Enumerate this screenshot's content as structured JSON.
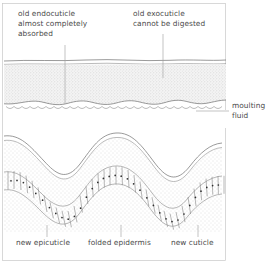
{
  "figure": {
    "frame": {
      "x": 2,
      "y": 3,
      "width": 224,
      "height": 258,
      "color": "#c8c8c8"
    }
  },
  "labels": {
    "top_left": {
      "name": "old-endocuticle-label",
      "lines": [
        "old endocuticle",
        "almost completely",
        "absorbed"
      ],
      "x": 18,
      "y": 16,
      "leader": {
        "x": 65,
        "y1": 45,
        "y2": 104
      }
    },
    "top_right": {
      "name": "old-exocuticle-label",
      "lines": [
        "old exocuticle",
        "cannot be digested"
      ],
      "x": 133,
      "y": 16,
      "leader": {
        "x": 163,
        "y1": 34,
        "y2": 78
      }
    },
    "right": {
      "name": "moulting-fluid-label",
      "lines": [
        "moulting",
        "fluid"
      ],
      "x": 232,
      "y": 104,
      "leader": {
        "x1": 196,
        "x2": 229,
        "y": 111
      }
    },
    "bottom": [
      {
        "name": "new-epicuticle-label",
        "text": "new epicuticle",
        "x": 16,
        "y": 245,
        "leader": {
          "x": 47,
          "y1": 225,
          "y2": 237
        }
      },
      {
        "name": "folded-epidermis-label",
        "text": "folded epidermis",
        "x": 88,
        "y": 245,
        "leader": {
          "x": 121,
          "y1": 225,
          "y2": 237
        }
      },
      {
        "name": "new-cuticle-label",
        "text": "new cuticle",
        "x": 171,
        "y": 245,
        "leader": {
          "x": 198,
          "y1": 225,
          "y2": 237
        }
      }
    ]
  },
  "layers": {
    "old_epicuticle": {
      "name": "old-epicuticle-band",
      "y": 60,
      "color": "#6e6e6e"
    },
    "old_exocuticle": {
      "name": "old-exocuticle-band",
      "y_top": 64,
      "y_bottom": 99,
      "fill": "#f2f2f2",
      "stipple": "fine"
    },
    "moulting_fluid_gap": {
      "name": "moulting-fluid-zone",
      "y_top": 99,
      "y_bottom": 128,
      "fill": "#ffffff"
    },
    "new_epicuticle": {
      "name": "new-epicuticle-wavy-line",
      "color": "#5a5a5a",
      "wave_amplitude": 17
    },
    "new_cuticle": {
      "name": "new-cuticle-band",
      "fill": "#fafafa",
      "stipple": "fine"
    },
    "folded_epidermis": {
      "name": "folded-epidermis-cell-layer",
      "cell_count": 46,
      "nucleus_color": "#2e2e2e"
    }
  },
  "colors": {
    "text": "#4a4a4a",
    "leader": "#9a9a9a",
    "frame": "#c8c8c8",
    "outline": "#6e6e6e",
    "stipple": "#b9b9b9"
  }
}
